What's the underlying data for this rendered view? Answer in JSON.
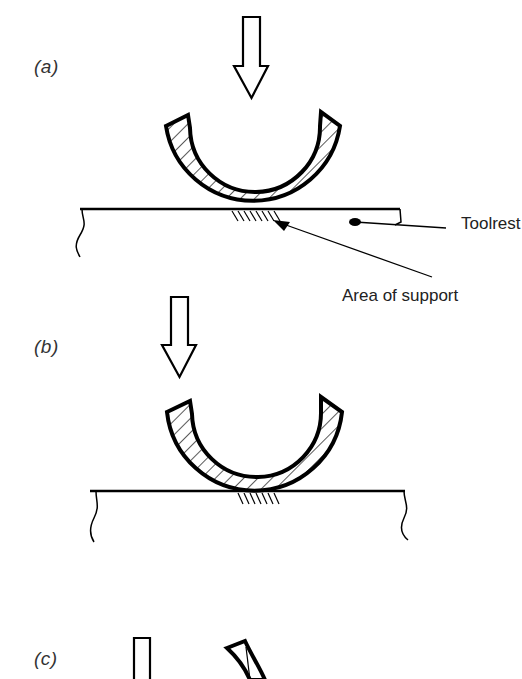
{
  "figure": {
    "panels": [
      {
        "id": "a",
        "label": "(a)"
      },
      {
        "id": "b",
        "label": "(b)"
      },
      {
        "id": "c",
        "label": "(c)"
      }
    ],
    "annotations": {
      "toolrest": "Toolrest",
      "area_of_support": "Area of support"
    },
    "colors": {
      "ink": "#000000",
      "background": "#ffffff",
      "label_text": "#333333"
    }
  }
}
